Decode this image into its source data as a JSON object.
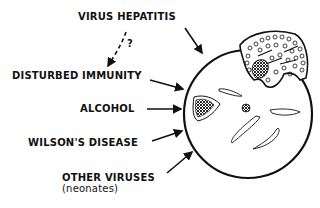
{
  "diagram": {
    "type": "causes-of-liver-lesion",
    "labels": {
      "virus_hepatitis": "VIRUS HEPATITIS",
      "question_mark": "?",
      "disturbed_immunity": "DISTURBED IMMUNITY",
      "alcohol": "ALCOHOL",
      "wilsons_disease": "WILSON'S DISEASE",
      "other_viruses": "OTHER VIRUSES",
      "neonates": "(neonates)"
    },
    "colors": {
      "ink": "#111111",
      "background": "#ffffff"
    }
  }
}
